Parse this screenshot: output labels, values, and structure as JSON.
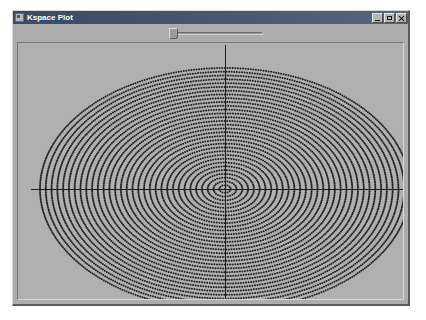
{
  "window": {
    "title": "Kspace Plot",
    "icon": "app-icon",
    "controls": [
      {
        "name": "minimize",
        "label": "_"
      },
      {
        "name": "maximize",
        "label": "□"
      },
      {
        "name": "close",
        "label": "×"
      }
    ]
  },
  "toolbar": {
    "slider": {
      "name": "parameter-slider",
      "value": 2,
      "min": 0,
      "max": 100,
      "track_left": 154,
      "track_width": 96
    }
  },
  "plot": {
    "name": "kspace-plot",
    "background_color": "#b0b0b0",
    "axis_color": "#1c1c1c",
    "dot_color": "#202020",
    "chart_data": {
      "type": "scatter",
      "title": "Kspace Plot",
      "xlabel": "",
      "ylabel": "",
      "description": "Concentric elliptical rings of discrete sample points in reciprocal (k) space, with horizontal and vertical axis crosshair lines through the origin.",
      "center_x": 212,
      "center_y": 178,
      "semi_axis_x": 185,
      "semi_axis_y": 121,
      "ring_count": 32,
      "ring_spacing_px": 5.8,
      "points_per_ring_base": 14,
      "dot_radius_px": 1.0,
      "axes": {
        "horizontal_line": {
          "x1": 18,
          "x2": 392,
          "y": 178
        },
        "vertical_line": {
          "x": 212,
          "y1": 34,
          "y2": 288
        }
      },
      "grid": false,
      "legend": null
    }
  }
}
